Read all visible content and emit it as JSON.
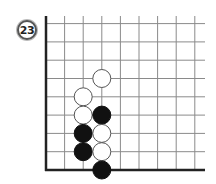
{
  "diagram": {
    "problem_number": "23",
    "board": {
      "columns": 9,
      "rows": 9,
      "origin_corner": "bottom-left",
      "edges": [
        "left",
        "bottom"
      ],
      "grid_color": "#8a8a8a",
      "edge_color": "#222222"
    },
    "stones": [
      {
        "color": "white",
        "col": 2,
        "row": 4
      },
      {
        "color": "white",
        "col": 2,
        "row": 3
      },
      {
        "color": "black",
        "col": 2,
        "row": 2
      },
      {
        "color": "black",
        "col": 2,
        "row": 1
      },
      {
        "color": "white",
        "col": 3,
        "row": 5
      },
      {
        "color": "black",
        "col": 3,
        "row": 3
      },
      {
        "color": "white",
        "col": 3,
        "row": 2
      },
      {
        "color": "white",
        "col": 3,
        "row": 1
      },
      {
        "color": "black",
        "col": 3,
        "row": 0
      }
    ]
  }
}
